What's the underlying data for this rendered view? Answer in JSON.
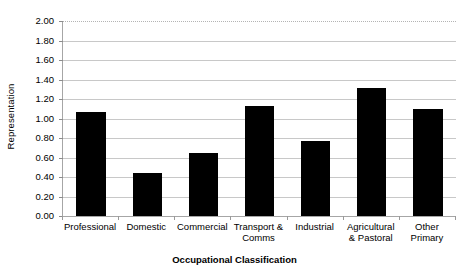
{
  "chart_data": {
    "type": "bar",
    "title": "",
    "xlabel": "Occupational Classification",
    "ylabel": "Representation",
    "categories": [
      "Professional",
      "Domestic",
      "Commercial",
      "Transport & Comms",
      "Industrial",
      "Agricultural & Pastoral",
      "Other Primary"
    ],
    "category_lines": [
      [
        "Professional"
      ],
      [
        "Domestic"
      ],
      [
        "Commercial"
      ],
      [
        "Transport &",
        "Comms"
      ],
      [
        "Industrial"
      ],
      [
        "Agricultural",
        "& Pastoral"
      ],
      [
        "Other",
        "Primary"
      ]
    ],
    "values": [
      1.07,
      0.44,
      0.65,
      1.13,
      0.77,
      1.31,
      1.1
    ],
    "ylim": [
      0.0,
      2.0
    ],
    "ytick_step": 0.2,
    "ytick_labels": [
      "2.00",
      "1.80",
      "1.60",
      "1.40",
      "1.20",
      "1.00",
      "0.80",
      "0.60",
      "0.40",
      "0.20",
      "0.00"
    ],
    "ytick_values": [
      2.0,
      1.8,
      1.6,
      1.4,
      1.2,
      1.0,
      0.8,
      0.6,
      0.4,
      0.2,
      0.0
    ],
    "grid": true,
    "legend": null,
    "bar_color": "#000000",
    "gridline_color": "#c8c8c8",
    "axis_color": "#a6a6a6",
    "background_color": "#ffffff"
  }
}
